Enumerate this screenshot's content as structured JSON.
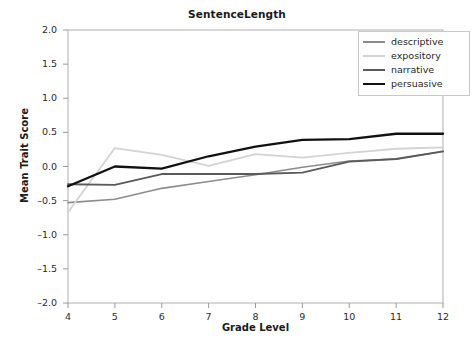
{
  "chart_data": {
    "type": "line",
    "title": "SentenceLength",
    "xlabel": "Grade Level",
    "ylabel": "Mean Trait Score",
    "x": [
      4,
      5,
      6,
      7,
      8,
      9,
      10,
      11,
      12
    ],
    "xlim": [
      4,
      12
    ],
    "ylim": [
      -2.0,
      2.0
    ],
    "xticks": [
      "4",
      "5",
      "6",
      "7",
      "8",
      "9",
      "10",
      "11",
      "12"
    ],
    "yticks": [
      "2.0",
      "1.5",
      "1.0",
      "0.5",
      "0.0",
      "-0.5",
      "-1.0",
      "-1.5",
      "-2.0"
    ],
    "ytick_values": [
      2.0,
      1.5,
      1.0,
      0.5,
      0.0,
      -0.5,
      -1.0,
      -1.5,
      -2.0
    ],
    "grid": false,
    "legend_position": "top-right",
    "series": [
      {
        "name": "descriptive",
        "color": "#8c8c8c",
        "width": 1.6,
        "values": [
          -0.53,
          -0.48,
          -0.32,
          -0.22,
          -0.12,
          -0.01,
          0.08,
          0.11,
          0.22
        ]
      },
      {
        "name": "expository",
        "color": "#d3d3d3",
        "width": 1.8,
        "values": [
          -0.67,
          0.27,
          0.17,
          0.01,
          0.18,
          0.13,
          0.2,
          0.26,
          0.28
        ]
      },
      {
        "name": "narrative",
        "color": "#5a5a5a",
        "width": 1.8,
        "values": [
          -0.26,
          -0.27,
          -0.11,
          -0.11,
          -0.11,
          -0.09,
          0.07,
          0.11,
          0.22
        ]
      },
      {
        "name": "persuasive",
        "color": "#111111",
        "width": 2.3,
        "values": [
          -0.29,
          0.0,
          -0.03,
          0.15,
          0.29,
          0.39,
          0.4,
          0.48,
          0.48
        ]
      }
    ]
  },
  "legend": {
    "items": [
      {
        "label": "descriptive"
      },
      {
        "label": "expository"
      },
      {
        "label": "narrative"
      },
      {
        "label": "persuasive"
      }
    ]
  },
  "axes": {
    "frame_color": "#b0b0b0",
    "tick_color": "#9a9a9a"
  }
}
